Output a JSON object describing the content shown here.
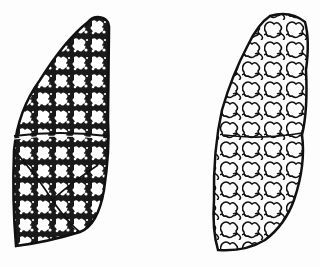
{
  "figure": {
    "colors": {
      "ink": "#111111",
      "paper": "#fdfdfd"
    },
    "left_lung": {
      "label": "",
      "texture": "dense-reticular"
    },
    "right_lung": {
      "label": "",
      "texture": "enlarged-bubbles"
    }
  }
}
